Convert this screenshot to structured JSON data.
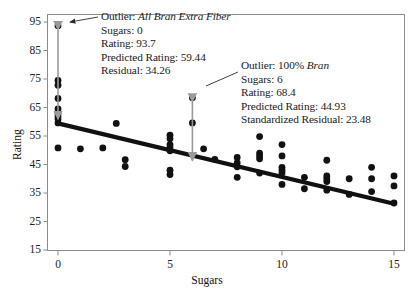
{
  "chart_data": {
    "type": "scatter",
    "title": "",
    "xlabel": "Sugars",
    "ylabel": "Rating",
    "xlim": [
      -0.75,
      15.75
    ],
    "ylim": [
      12.5,
      97.5
    ],
    "xticks": [
      0,
      5,
      10,
      15
    ],
    "yticks": [
      15,
      25,
      35,
      45,
      55,
      65,
      75,
      85,
      95
    ],
    "grid": false,
    "legend": null,
    "marker": {
      "shape": "circle",
      "color": "#111111",
      "size": 3.4
    },
    "regression_line": {
      "label": "least-squares regression line",
      "color": "#111111",
      "width": 4.2,
      "x_start": 0,
      "y_start": 59.44,
      "x_end": 15,
      "y_end": 31.2
    },
    "points": [
      {
        "x": 0,
        "y": 93.7
      },
      {
        "x": 0,
        "y": 74.5
      },
      {
        "x": 0,
        "y": 72.8
      },
      {
        "x": 0,
        "y": 68.2
      },
      {
        "x": 0,
        "y": 64.5
      },
      {
        "x": 0,
        "y": 63.0
      },
      {
        "x": 0,
        "y": 62.0
      },
      {
        "x": 0,
        "y": 61.0
      },
      {
        "x": 0,
        "y": 59.6
      },
      {
        "x": 0,
        "y": 50.8
      },
      {
        "x": 1,
        "y": 50.5
      },
      {
        "x": 2,
        "y": 50.8
      },
      {
        "x": 2.6,
        "y": 59.4
      },
      {
        "x": 3,
        "y": 46.7
      },
      {
        "x": 3,
        "y": 44.3
      },
      {
        "x": 5,
        "y": 55.3
      },
      {
        "x": 5,
        "y": 54.0
      },
      {
        "x": 5,
        "y": 52.0
      },
      {
        "x": 5,
        "y": 51.0
      },
      {
        "x": 5,
        "y": 49.8
      },
      {
        "x": 5,
        "y": 43.0
      },
      {
        "x": 5,
        "y": 41.5
      },
      {
        "x": 6,
        "y": 68.4
      },
      {
        "x": 6,
        "y": 59.6
      },
      {
        "x": 6.5,
        "y": 50.5
      },
      {
        "x": 7,
        "y": 46.8
      },
      {
        "x": 8,
        "y": 47.5
      },
      {
        "x": 8,
        "y": 45.6
      },
      {
        "x": 8,
        "y": 44.2
      },
      {
        "x": 8,
        "y": 40.5
      },
      {
        "x": 9,
        "y": 54.8
      },
      {
        "x": 9,
        "y": 49.0
      },
      {
        "x": 9,
        "y": 48.0
      },
      {
        "x": 9,
        "y": 47.0
      },
      {
        "x": 9,
        "y": 42.0
      },
      {
        "x": 10,
        "y": 52.0
      },
      {
        "x": 10,
        "y": 48.0
      },
      {
        "x": 10,
        "y": 44.0
      },
      {
        "x": 10,
        "y": 43.0
      },
      {
        "x": 10,
        "y": 42.0
      },
      {
        "x": 10,
        "y": 38.0
      },
      {
        "x": 11,
        "y": 40.5
      },
      {
        "x": 11,
        "y": 36.5
      },
      {
        "x": 12,
        "y": 46.5
      },
      {
        "x": 12,
        "y": 41.0
      },
      {
        "x": 12,
        "y": 40.0
      },
      {
        "x": 12,
        "y": 39.0
      },
      {
        "x": 12,
        "y": 36.0
      },
      {
        "x": 13,
        "y": 40.0
      },
      {
        "x": 13,
        "y": 34.5
      },
      {
        "x": 14,
        "y": 44.0
      },
      {
        "x": 14,
        "y": 40.0
      },
      {
        "x": 14,
        "y": 35.5
      },
      {
        "x": 15,
        "y": 41.0
      },
      {
        "x": 15,
        "y": 37.5
      },
      {
        "x": 15,
        "y": 31.5
      }
    ],
    "annotations": [
      {
        "id": "outlier-all-bran",
        "target_point": {
          "x": 0,
          "y": 93.7
        },
        "residual_arrow": {
          "x": 0,
          "y_top": 93.7,
          "y_bottom": 59.44,
          "color": "#9a9a9a"
        },
        "lines": [
          {
            "prefix": "Outlier: ",
            "italic": "All Bran Extra Fiber"
          },
          {
            "prefix": "Sugars: 0",
            "italic": ""
          },
          {
            "prefix": "Rating: 93.7",
            "italic": ""
          },
          {
            "prefix": "Predicted Rating: 59.44",
            "italic": ""
          },
          {
            "prefix": "Residual: 34.26",
            "italic": ""
          }
        ]
      },
      {
        "id": "outlier-100-bran",
        "target_point": {
          "x": 6,
          "y": 68.4
        },
        "residual_arrow": {
          "x": 6,
          "y_top": 68.4,
          "y_bottom": 44.93,
          "color": "#9a9a9a"
        },
        "lines": [
          {
            "prefix": "Outlier: 100% ",
            "italic": "Bran"
          },
          {
            "prefix": "Sugars: 6",
            "italic": ""
          },
          {
            "prefix": "Rating: 68.4",
            "italic": ""
          },
          {
            "prefix": "Predicted Rating: 44.93",
            "italic": ""
          },
          {
            "prefix": "Standardized Residual: 23.48",
            "italic": ""
          }
        ]
      }
    ]
  }
}
